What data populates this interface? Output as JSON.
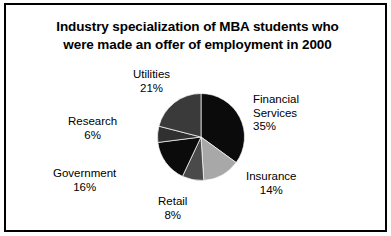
{
  "chart_data": {
    "type": "pie",
    "title": "Industry specialization of MBA students who were made an offer of employment in 2000",
    "title_lines": [
      "Industry specialization of MBA students who",
      "were made an offer of employment in 2000"
    ],
    "xlabel": "",
    "ylabel": "",
    "legend": "none",
    "grid": false,
    "units": "percent",
    "start_angle_deg": 0,
    "direction": "clockwise",
    "categories": [
      "Financial Services",
      "Insurance",
      "Retail",
      "Government",
      "Research",
      "Utilities"
    ],
    "values": [
      35,
      14,
      8,
      16,
      6,
      21
    ],
    "slices": [
      {
        "name": "Financial Services",
        "name_lines": [
          "Financial",
          "Services"
        ],
        "value": 35,
        "pct_label": "35%",
        "color": "#0b0b0b"
      },
      {
        "name": "Insurance",
        "name_lines": [
          "Insurance"
        ],
        "value": 14,
        "pct_label": "14%",
        "color": "#a8a8a8"
      },
      {
        "name": "Retail",
        "name_lines": [
          "Retail"
        ],
        "value": 8,
        "pct_label": "8%",
        "color": "#4a4a4a"
      },
      {
        "name": "Government",
        "name_lines": [
          "Government"
        ],
        "value": 16,
        "pct_label": "16%",
        "color": "#0b0b0b"
      },
      {
        "name": "Research",
        "name_lines": [
          "Research"
        ],
        "value": 6,
        "pct_label": "6%",
        "color": "#303030"
      },
      {
        "name": "Utilities",
        "name_lines": [
          "Utilities"
        ],
        "value": 21,
        "pct_label": "21%",
        "color": "#3a3a3a"
      }
    ]
  },
  "figure": {
    "border_color": "#000000",
    "background": "#ffffff"
  }
}
